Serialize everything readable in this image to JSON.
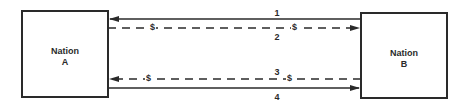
{
  "diagram": {
    "type": "flow-diagram",
    "colors": {
      "stroke": "#2a2a2a",
      "background": "#ffffff"
    },
    "nodes": [
      {
        "id": "A",
        "line1": "Nation",
        "line2": "A"
      },
      {
        "id": "B",
        "line1": "Nation",
        "line2": "B"
      }
    ],
    "flows": [
      {
        "label": "1",
        "from": "B",
        "to": "A",
        "style": "solid",
        "money": false
      },
      {
        "label": "2",
        "from": "A",
        "to": "B",
        "style": "dashed",
        "money": true,
        "money_symbol": "$"
      },
      {
        "label": "3",
        "from": "B",
        "to": "A",
        "style": "dashed",
        "money": true,
        "money_symbol": "$"
      },
      {
        "label": "4",
        "from": "A",
        "to": "B",
        "style": "solid",
        "money": false
      }
    ]
  }
}
